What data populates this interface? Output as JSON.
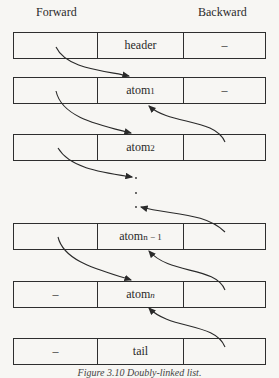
{
  "columns": {
    "forward": "Forward",
    "backward": "Backward"
  },
  "rows": [
    {
      "forward": "",
      "value": "header",
      "sub": "",
      "backward": "–",
      "top": 32
    },
    {
      "forward": "",
      "value": "atom",
      "sub": "1",
      "backward": "–",
      "top": 77
    },
    {
      "forward": "",
      "value": "atom",
      "sub": "2",
      "backward": "",
      "top": 134
    },
    {
      "forward": "",
      "value": "atom",
      "sub": "n − 1",
      "backward": "",
      "top": 223
    },
    {
      "forward": "–",
      "value": "atom",
      "sub": "n",
      "backward": "",
      "top": 281
    },
    {
      "forward": "–",
      "value": "tail",
      "sub": "",
      "backward": "",
      "top": 338
    }
  ],
  "ellipsis": ".",
  "caption": "Figure 3.10 Doubly-linked list."
}
